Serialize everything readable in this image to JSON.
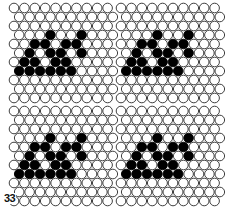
{
  "figure": {
    "label": "33"
  },
  "colors": {
    "background": "#ffffff",
    "bead_outline": "#2a2a2a",
    "bead_empty": "#ffffff",
    "bead_filled": "#000000"
  },
  "grid": {
    "bead_diameter": 10.4,
    "row_pitch": 9.0,
    "col_pitch": 10.4,
    "panels": [
      {
        "name": "top-left",
        "x0": 14,
        "y0": 8,
        "cols": 10,
        "rows": 11
      },
      {
        "name": "top-right",
        "x0": 121,
        "y0": 8,
        "cols": 10,
        "rows": 11
      },
      {
        "name": "bottom-left",
        "x0": 14,
        "y0": 111,
        "cols": 10,
        "rows": 11
      },
      {
        "name": "bottom-right",
        "x0": 121,
        "y0": 111,
        "cols": 10,
        "rows": 11
      }
    ]
  },
  "motif": {
    "name": "slanted-triple-stroke",
    "filled_cells": [
      [
        3,
        6
      ],
      [
        3,
        9
      ],
      [
        4,
        5
      ],
      [
        4,
        6
      ],
      [
        4,
        8
      ],
      [
        4,
        9
      ],
      [
        5,
        4
      ],
      [
        5,
        6
      ],
      [
        5,
        7
      ],
      [
        5,
        9
      ],
      [
        6,
        4
      ],
      [
        6,
        5
      ],
      [
        6,
        7
      ],
      [
        6,
        8
      ],
      [
        7,
        3
      ],
      [
        7,
        4
      ],
      [
        7,
        5
      ],
      [
        7,
        6
      ],
      [
        7,
        7
      ],
      [
        7,
        8
      ]
    ],
    "col_shift_per_panel": -3
  }
}
